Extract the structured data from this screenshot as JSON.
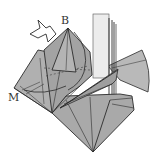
{
  "diagram": {
    "type": "origami-folding-step",
    "labels": {
      "b": "B",
      "m": "M"
    },
    "arrow": {
      "kind": "hollow-push-arrow",
      "direction": "down-right toward point B"
    },
    "colors": {
      "paper": "#a9a9a9",
      "paper_light": "#bdbdbd",
      "paper_dark": "#8f8f8f",
      "white_layer": "#ececec",
      "line": "#2b2b2b",
      "background": "#ffffff"
    }
  }
}
